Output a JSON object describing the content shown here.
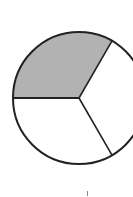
{
  "diagram": {
    "type": "fraction-circle",
    "total_parts": 3,
    "shaded_parts": 1,
    "center": [
      79,
      98
    ],
    "radius": 66,
    "shade_color": "#b5b5b5",
    "stroke_color": "#222222",
    "divider_angles_deg": [
      180,
      300,
      60
    ],
    "footer_mark": "I"
  }
}
